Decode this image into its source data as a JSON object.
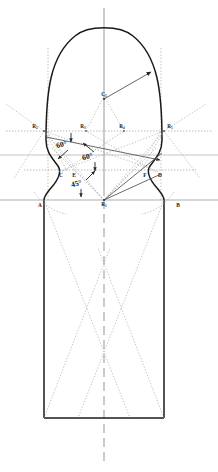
{
  "figure": {
    "type": "technical-drawing",
    "width": 218,
    "height": 472,
    "background_color": "#ffffff"
  },
  "colors": {
    "outline": "#1a1a1a",
    "construction_solid": "#5a5a5a",
    "construction_dotted": "#9a9a9a",
    "axis_gray": "#b4b4b4",
    "centerline": "#9e9e9e",
    "label": "#1c1c1c"
  },
  "labels": {
    "points": [
      {
        "id": "A",
        "text": "A",
        "x": 40,
        "y": 207
      },
      {
        "id": "B",
        "text": "B",
        "x": 178,
        "y": 207
      },
      {
        "id": "C",
        "text": "C",
        "x": 61,
        "y": 177
      },
      {
        "id": "E",
        "text": "E",
        "x": 74,
        "y": 177
      },
      {
        "id": "F",
        "text": "F",
        "x": 145,
        "y": 177
      },
      {
        "id": "D",
        "text": "D",
        "x": 160,
        "y": 177
      }
    ],
    "radius_points": [
      {
        "id": "R1",
        "base": "R",
        "sub": "1",
        "x": 104,
        "y": 206
      },
      {
        "id": "R2",
        "base": "R",
        "sub": "2",
        "x": 35,
        "y": 128
      },
      {
        "id": "R3",
        "base": "R",
        "sub": "3",
        "x": 83,
        "y": 128
      },
      {
        "id": "R4",
        "base": "R",
        "sub": "4",
        "x": 122,
        "y": 128
      },
      {
        "id": "R5",
        "base": "R",
        "sub": "5",
        "x": 170,
        "y": 128
      },
      {
        "id": "C1",
        "base": "C",
        "sub": "1",
        "x": 104,
        "y": 96
      }
    ],
    "angles": [
      {
        "id": "angle-60-left",
        "text": "60°",
        "x": 62,
        "y": 147
      },
      {
        "id": "angle-60-right",
        "text": "60°",
        "x": 88,
        "y": 159
      },
      {
        "id": "angle-45",
        "text": "45°",
        "x": 77,
        "y": 186
      }
    ]
  },
  "geometry": {
    "centerline_x": 104,
    "baseline_y": 200,
    "shoulder_y": 155,
    "neck_y": 170,
    "body_left_x": 44,
    "body_right_x": 165,
    "body_bottom_y": 418,
    "arch_apex_y": 27,
    "dome_radius": 62
  }
}
